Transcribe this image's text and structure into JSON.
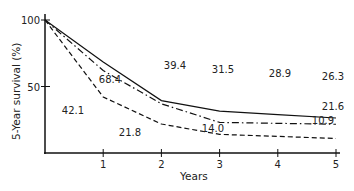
{
  "chart_data": {
    "type": "line",
    "title": "",
    "xlabel": "Years",
    "ylabel": "5-Year survival (%)",
    "x": [
      0,
      1,
      2,
      3,
      4,
      5
    ],
    "xticks": [
      "1",
      "2",
      "3",
      "4",
      "5"
    ],
    "yticks": [
      "100",
      "50"
    ],
    "xlim": [
      0,
      5
    ],
    "ylim": [
      0,
      100
    ],
    "grid": false,
    "legend": "none",
    "series": [
      {
        "name": "solid",
        "style": "solid",
        "values": [
          100,
          68.4,
          39.4,
          31.5,
          28.9,
          26.3
        ]
      },
      {
        "name": "dash-dot",
        "style": "dash-dot",
        "values": [
          100,
          62,
          37,
          23,
          22.3,
          21.6
        ]
      },
      {
        "name": "dashed",
        "style": "dashed",
        "values": [
          100,
          42.1,
          21.8,
          14.0,
          12.5,
          10.9
        ]
      }
    ],
    "annotations": [
      "68.4",
      "39.4",
      "31.5",
      "28.9",
      "26.3",
      "21.6",
      "42.1",
      "21.8",
      "14.0",
      "10.9"
    ]
  }
}
